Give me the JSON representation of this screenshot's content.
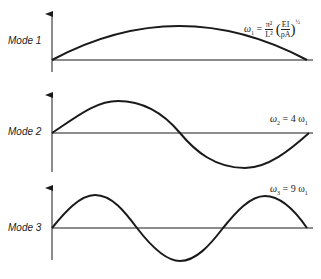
{
  "diagram": {
    "modes": [
      {
        "label": "Mode 1",
        "equation": {
          "lhs": "ω",
          "lhs_sub": "1",
          "equals": "=",
          "frac_num": "π²",
          "frac_den": "L²",
          "inner_num": "EI",
          "inner_den": "ρA",
          "exponent": "½"
        },
        "equation_text": "ω1 = π²/L² (EI/ρA)^½"
      },
      {
        "label": "Mode 2",
        "equation": {
          "lhs": "ω",
          "lhs_sub": "2",
          "rhs": "= 4 ω",
          "rhs_sub": "1"
        },
        "equation_text": "ω2 = 4 ω1"
      },
      {
        "label": "Mode 3",
        "equation": {
          "lhs": "ω",
          "lhs_sub": "3",
          "rhs": "= 9 ω",
          "rhs_sub": "1"
        },
        "equation_text": "ω3 = 9 ω1"
      }
    ],
    "line_color": "#1a1a1a"
  }
}
